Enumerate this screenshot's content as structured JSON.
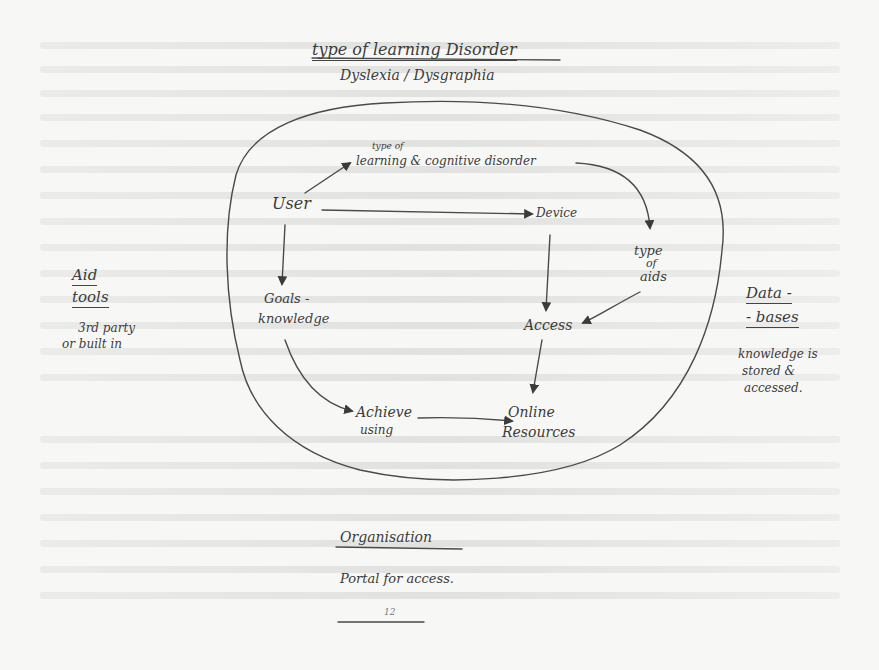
{
  "diagram": {
    "title": "type of learning Disorder",
    "subtitle": "Dyslexia / Dysgraphia",
    "nodes": {
      "user": "User",
      "disorder_small": "type of",
      "disorder": "learning & cognitive disorder",
      "device": "Device",
      "type_of_aids": [
        "type",
        "of",
        "aids"
      ],
      "goals": [
        "Goals -",
        "knowledge"
      ],
      "access": "Access",
      "achieve": [
        "Achieve",
        "using"
      ],
      "online": [
        "Online",
        "Resources"
      ]
    },
    "side_left": {
      "heading": [
        "Aid",
        "tools"
      ],
      "note": [
        "3rd party",
        "or built in"
      ]
    },
    "side_right": {
      "heading": [
        "Data -",
        "- bases"
      ],
      "note": [
        "knowledge is",
        "stored &",
        "accessed."
      ]
    },
    "footer": {
      "heading": "Organisation",
      "note": "Portal for access.",
      "page_mark": "12"
    },
    "edges": [
      {
        "from": "User",
        "to": "type of learning & cognitive disorder"
      },
      {
        "from": "User",
        "to": "Device"
      },
      {
        "from": "User",
        "to": "Goals - knowledge"
      },
      {
        "from": "type of learning & cognitive disorder",
        "to": "type of aids"
      },
      {
        "from": "Device",
        "to": "Access"
      },
      {
        "from": "type of aids",
        "to": "Access"
      },
      {
        "from": "Access",
        "to": "Online Resources"
      },
      {
        "from": "Goals - knowledge",
        "to": "Achieve using"
      },
      {
        "from": "Achieve using",
        "to": "Online Resources"
      }
    ],
    "colors": {
      "ink": "#3b3b3b",
      "paper": "#f7f7f5"
    }
  }
}
